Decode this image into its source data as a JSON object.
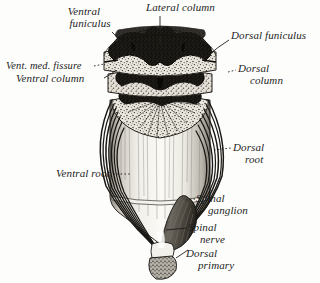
{
  "figure": {
    "style": "vintage anatomical engraving",
    "background_color": "#fdfdfc",
    "ink_color": "#1d1d1d",
    "gray_matter_color": "#14120f",
    "white_matter_color": "#e8e5dd"
  },
  "labels": {
    "ventral_funiculus_line1": "Ventral",
    "ventral_funiculus_line2": "funiculus",
    "lateral_column": "Lateral column",
    "dorsal_funiculus": "Dorsal funiculus",
    "vent_med_fissure": "Vent. med. fissure",
    "ventral_column": "Ventral column",
    "dorsal_column_line1": "Dorsal",
    "dorsal_column_line2": "column",
    "dorsal_root_line1": "Dorsal",
    "dorsal_root_line2": "root",
    "ventral_root": "Ventral root",
    "spinal_ganglion_line1": "Spinal",
    "spinal_ganglion_line2": "ganglion",
    "spinal_nerve_line1": "Spinal",
    "spinal_nerve_line2": "nerve",
    "dorsal_primary_line1": "Dorsal",
    "dorsal_primary_line2": "primary"
  },
  "structures": [
    {
      "name": "ventral-funiculus",
      "label": "Ventral funiculus",
      "region": "upper-left white matter"
    },
    {
      "name": "lateral-column",
      "label": "Lateral column",
      "region": "top center gray matter"
    },
    {
      "name": "dorsal-funiculus",
      "label": "Dorsal funiculus",
      "region": "upper-right white matter"
    },
    {
      "name": "ventral-median-fissure",
      "label": "Vent. med. fissure",
      "region": "anterior midline cleft"
    },
    {
      "name": "ventral-column",
      "label": "Ventral column",
      "region": "anterior gray horn"
    },
    {
      "name": "dorsal-column",
      "label": "Dorsal column",
      "region": "posterior gray horn"
    },
    {
      "name": "dorsal-root",
      "label": "Dorsal root",
      "region": "posterior rootlets"
    },
    {
      "name": "ventral-root",
      "label": "Ventral root",
      "region": "anterior rootlets"
    },
    {
      "name": "spinal-ganglion",
      "label": "Spinal ganglion",
      "region": "dorsal root swelling"
    },
    {
      "name": "spinal-nerve",
      "label": "Spinal nerve",
      "region": "mixed nerve trunk"
    },
    {
      "name": "dorsal-primary",
      "label": "Dorsal primary",
      "region": "primary ramus stump"
    }
  ]
}
